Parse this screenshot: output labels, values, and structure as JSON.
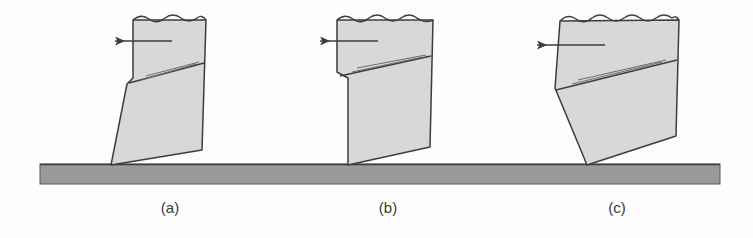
{
  "figure": {
    "colors": {
      "tool_fill": "#d8d8d8",
      "tool_stroke": "#3c3c3c",
      "ground_fill": "#9a9a9a",
      "ground_stroke": "#4a4a4a",
      "arrow": "#3c3c3c",
      "caption_text": "#3a3a3a",
      "background": "#fdfdfd"
    },
    "ground": {
      "name": "workpiece-surface-bar",
      "x": 40,
      "y": 164,
      "width": 680,
      "height": 20
    },
    "captions": [
      {
        "label": "(a)",
        "x": 170,
        "y": 213
      },
      {
        "label": "(b)",
        "x": 388,
        "y": 213
      },
      {
        "label": "(c)",
        "x": 617,
        "y": 213
      }
    ],
    "panels": [
      {
        "id": "panel-a",
        "caption": "(a)",
        "tool_body": "M133,20 L133,78 L127,84 L111,165 L202,150 L206,20 Z",
        "top_break_line": "M133,20 Q141,13 149,19 Q157,25 165,18 Q173,12 181,18 Q189,24 197,18 Q202,14 206,20",
        "rake_line": "M129,83 L204,63",
        "hatch_lines": [
          "M141,80 L196,64",
          "M146,76 L199,62"
        ],
        "arrow": {
          "x1": 172,
          "y1": 41,
          "x2": 115,
          "y2": 41,
          "direction": "left"
        },
        "tip": {
          "x": 111,
          "y": 165
        }
      },
      {
        "id": "panel-b",
        "caption": "(b)",
        "tool_body": "M337,20 L337,72 L348,78 L348,165 L430,147 L433,20 Z",
        "top_break_line": "M337,20 Q345,13 353,19 Q361,25 369,18 Q377,12 385,18 Q393,24 401,18 Q409,12 417,18 Q425,24 433,20",
        "rake_line": "M340,76 L431,56",
        "hatch_lines": [
          "M352,72 L423,57",
          "M357,68 L426,55"
        ],
        "arrow": {
          "x1": 378,
          "y1": 41,
          "x2": 320,
          "y2": 41,
          "direction": "left"
        },
        "tip": {
          "x": 348,
          "y": 165
        }
      },
      {
        "id": "panel-c",
        "caption": "(c)",
        "tool_body": "M560,21 L555,88 L587,165 L676,136 L679,20 Z",
        "top_break_line": "M560,21 Q568,13 576,19 Q584,25 592,18 Q600,12 608,18 Q616,24 624,18 Q632,12 640,18 Q648,24 656,18 Q664,12 672,18 Q676,15 679,20",
        "rake_line": "M556,90 L677,60",
        "hatch_lines": [
          "M572,84 L662,62",
          "M578,80 L666,60"
        ],
        "arrow": {
          "x1": 605,
          "y1": 45,
          "x2": 537,
          "y2": 45,
          "direction": "left"
        },
        "tip": {
          "x": 587,
          "y": 165
        }
      }
    ]
  }
}
